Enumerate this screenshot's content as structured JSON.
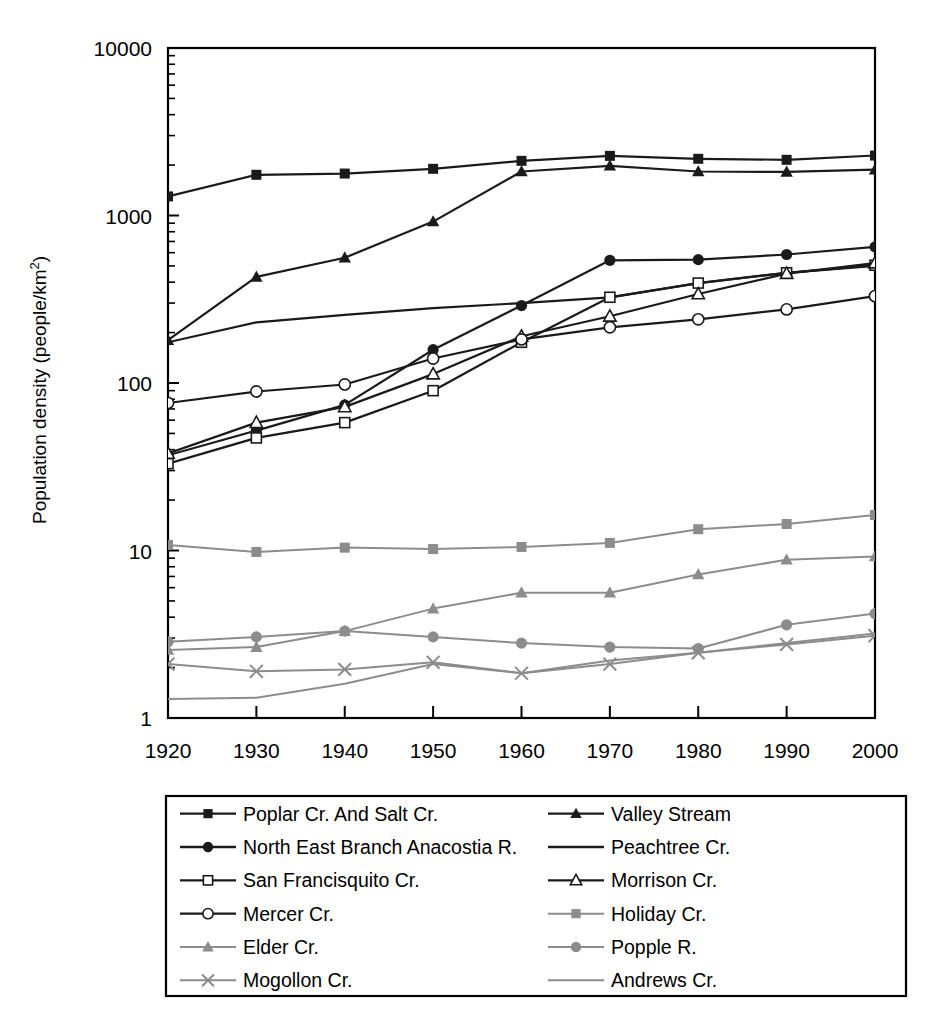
{
  "chart_data": {
    "type": "line",
    "title": "",
    "xlabel": "",
    "ylabel": "Population density (people/km2)",
    "ylabel_base": "Population density (people/km",
    "ylabel_sup": "2",
    "ylabel_tail": ")",
    "x": [
      1920,
      1930,
      1940,
      1950,
      1960,
      1970,
      1980,
      1990,
      2000
    ],
    "xtick_labels": [
      "1920",
      "1930",
      "1940",
      "1950",
      "1960",
      "1970",
      "1980",
      "1990",
      "2000"
    ],
    "ytick_labels": [
      "10000",
      "1000",
      "100",
      "10",
      "1"
    ],
    "ytick_values": [
      10000,
      1000,
      100,
      10,
      1
    ],
    "ylim": [
      1,
      10000
    ],
    "yscale": "log",
    "xlim": [
      1920,
      2000
    ],
    "grid": false,
    "legend_position": "below-plot",
    "minor_ticks": true,
    "series": [
      {
        "name": "Poplar Cr. And Salt Cr.",
        "marker": "filled-square",
        "color": "#1a1a1a",
        "values": [
          1300,
          1750,
          1780,
          1900,
          2120,
          2270,
          2180,
          2150,
          2280
        ]
      },
      {
        "name": "Valley Stream",
        "marker": "filled-triangle",
        "color": "#1a1a1a",
        "values": [
          180,
          430,
          560,
          920,
          1830,
          1980,
          1830,
          1820,
          1880
        ]
      },
      {
        "name": "North East Branch Anacostia R.",
        "marker": "filled-circle",
        "color": "#1a1a1a",
        "values": [
          37,
          52,
          74,
          158,
          290,
          540,
          545,
          585,
          650
        ]
      },
      {
        "name": "Peachtree Cr.",
        "marker": "none",
        "color": "#1a1a1a",
        "values": [
          175,
          230,
          255,
          280,
          300,
          325,
          395,
          455,
          500
        ]
      },
      {
        "name": "San Francisquito Cr.",
        "marker": "open-square",
        "color": "#1a1a1a",
        "values": [
          33,
          47,
          58,
          90,
          175,
          325,
          395,
          455,
          505
        ]
      },
      {
        "name": "Morrison Cr.",
        "marker": "open-triangle",
        "color": "#1a1a1a",
        "values": [
          38,
          58,
          72,
          113,
          190,
          250,
          340,
          450,
          520
        ]
      },
      {
        "name": "Mercer Cr.",
        "marker": "open-circle",
        "color": "#1a1a1a",
        "values": [
          76,
          89,
          98,
          140,
          182,
          215,
          240,
          275,
          330
        ]
      },
      {
        "name": "Holiday Cr.",
        "marker": "filled-square",
        "color": "#8c8c8c",
        "values": [
          10.8,
          9.8,
          10.4,
          10.2,
          10.5,
          11.1,
          13.4,
          14.4,
          16.3
        ]
      },
      {
        "name": "Elder Cr.",
        "marker": "filled-triangle",
        "color": "#8c8c8c",
        "values": [
          2.55,
          2.65,
          3.3,
          4.5,
          5.6,
          5.6,
          7.2,
          8.8,
          9.2
        ]
      },
      {
        "name": "Popple R.",
        "marker": "filled-circle",
        "color": "#8c8c8c",
        "values": [
          2.85,
          3.05,
          3.3,
          3.05,
          2.8,
          2.65,
          2.6,
          3.6,
          4.2
        ]
      },
      {
        "name": "Mogollon Cr.",
        "marker": "x-cross",
        "color": "#8c8c8c",
        "values": [
          2.1,
          1.9,
          1.95,
          2.15,
          1.85,
          2.1,
          2.45,
          2.75,
          3.1
        ]
      },
      {
        "name": "Andrews Cr.",
        "marker": "none",
        "color": "#8c8c8c",
        "values": [
          1.3,
          1.32,
          1.6,
          2.1,
          1.85,
          2.2,
          2.45,
          2.8,
          3.2
        ]
      }
    ],
    "legend": [
      {
        "label": "Poplar Cr. And Salt Cr.",
        "marker": "filled-square",
        "color": "#1a1a1a"
      },
      {
        "label": "Valley Stream",
        "marker": "filled-triangle",
        "color": "#1a1a1a"
      },
      {
        "label": "North East Branch Anacostia R.",
        "marker": "filled-circle",
        "color": "#1a1a1a"
      },
      {
        "label": "Peachtree Cr.",
        "marker": "none",
        "color": "#1a1a1a"
      },
      {
        "label": "San Francisquito Cr.",
        "marker": "open-square",
        "color": "#1a1a1a"
      },
      {
        "label": "Morrison Cr.",
        "marker": "open-triangle",
        "color": "#1a1a1a"
      },
      {
        "label": "Mercer Cr.",
        "marker": "open-circle",
        "color": "#1a1a1a"
      },
      {
        "label": "Holiday Cr.",
        "marker": "filled-square",
        "color": "#8c8c8c"
      },
      {
        "label": "Elder Cr.",
        "marker": "filled-triangle",
        "color": "#8c8c8c"
      },
      {
        "label": "Popple R.",
        "marker": "filled-circle",
        "color": "#8c8c8c"
      },
      {
        "label": "Mogollon Cr.",
        "marker": "x-cross",
        "color": "#8c8c8c"
      },
      {
        "label": "Andrews Cr.",
        "marker": "none",
        "color": "#8c8c8c"
      }
    ]
  }
}
